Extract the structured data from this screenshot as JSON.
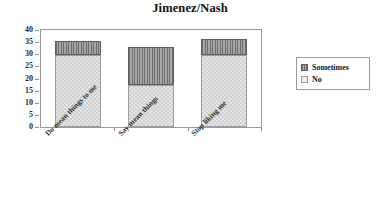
{
  "chart_data": {
    "type": "bar",
    "subtype": "stacked-bar",
    "title": "Jimenez/Nash",
    "xlabel": "",
    "ylabel": "",
    "categories": [
      "Do mean things to me",
      "Say mean things",
      "Stop liking me"
    ],
    "series": [
      {
        "name": "No",
        "values": [
          29.5,
          17.5,
          29.5
        ]
      },
      {
        "name": "Sometimes",
        "values": [
          6,
          15.5,
          7
        ]
      }
    ],
    "totals": [
      35.5,
      33,
      36.5
    ],
    "ylim": [
      0,
      40
    ],
    "yticks": [
      0,
      5,
      10,
      15,
      20,
      25,
      30,
      35,
      40
    ],
    "ytick_labels": [
      "0",
      "5",
      "10",
      "15",
      "20",
      "25",
      "30",
      "35",
      "40"
    ],
    "grid": false,
    "legend": {
      "position": "right",
      "entries": [
        {
          "label": "Sometimes",
          "color": "#8c8c8c",
          "pattern": "vertical-hatch"
        },
        {
          "label": "No",
          "color": "#e4e4e4",
          "pattern": "stipple"
        }
      ]
    },
    "xtick_label_rotation": -45,
    "frame": true,
    "colors": {
      "no": "#e4e4e4",
      "sometimes": "#8c8c8c",
      "axis": "#8f8f8f",
      "text": "#1a1a1a",
      "background": "#ffffff"
    }
  }
}
